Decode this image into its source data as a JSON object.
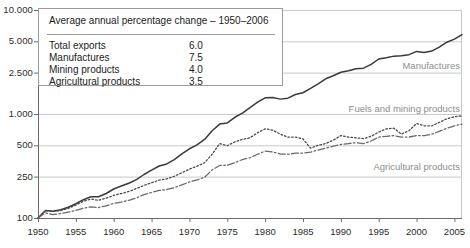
{
  "chart_data": {
    "type": "line",
    "title": "",
    "xlabel": "",
    "ylabel": "",
    "yscale": "log",
    "ylim": [
      100,
      10000
    ],
    "xlim": [
      1950,
      2006
    ],
    "grid": true,
    "legend_position": "inline-right",
    "ytick_labels": [
      "10.000",
      "5.000",
      "2.500",
      "1.000",
      "500",
      "250",
      "100"
    ],
    "ytick_values": [
      10000,
      5000,
      2500,
      1000,
      500,
      250,
      100
    ],
    "xtick_labels": [
      "1950",
      "1955",
      "1960",
      "1965",
      "1970",
      "1975",
      "1980",
      "1985",
      "1990",
      "1995",
      "2000",
      "2005"
    ],
    "xtick_values": [
      1950,
      1955,
      1960,
      1965,
      1970,
      1975,
      1980,
      1985,
      1990,
      1995,
      2000,
      2005
    ],
    "x": [
      1950,
      1951,
      1952,
      1953,
      1954,
      1955,
      1956,
      1957,
      1958,
      1959,
      1960,
      1961,
      1962,
      1963,
      1964,
      1965,
      1966,
      1967,
      1968,
      1969,
      1970,
      1971,
      1972,
      1973,
      1974,
      1975,
      1976,
      1977,
      1978,
      1979,
      1980,
      1981,
      1982,
      1983,
      1984,
      1985,
      1986,
      1987,
      1988,
      1989,
      1990,
      1991,
      1992,
      1993,
      1994,
      1995,
      1996,
      1997,
      1998,
      1999,
      2000,
      2001,
      2002,
      2003,
      2004,
      2005,
      2006
    ],
    "series": [
      {
        "name": "Manufactures",
        "style": "solid",
        "color": "#3a3a3a",
        "values": [
          100,
          118,
          116,
          120,
          127,
          137,
          150,
          160,
          160,
          172,
          190,
          203,
          216,
          234,
          262,
          288,
          316,
          331,
          364,
          414,
          463,
          505,
          570,
          690,
          800,
          820,
          930,
          1020,
          1150,
          1300,
          1430,
          1440,
          1390,
          1420,
          1540,
          1600,
          1760,
          1950,
          2180,
          2330,
          2520,
          2600,
          2720,
          2760,
          3000,
          3380,
          3480,
          3600,
          3630,
          3720,
          4000,
          3900,
          4030,
          4400,
          4900,
          5250,
          5800
        ]
      },
      {
        "name": "Fuels and mining products",
        "style": "dotted",
        "color": "#4a4a4a",
        "values": [
          100,
          118,
          116,
          118,
          124,
          133,
          145,
          152,
          148,
          155,
          165,
          172,
          180,
          192,
          206,
          218,
          231,
          238,
          252,
          272,
          295,
          315,
          340,
          410,
          520,
          495,
          540,
          570,
          590,
          660,
          720,
          700,
          640,
          600,
          600,
          575,
          470,
          500,
          520,
          560,
          620,
          600,
          590,
          580,
          610,
          670,
          720,
          730,
          640,
          690,
          810,
          770,
          770,
          830,
          900,
          940,
          960
        ]
      },
      {
        "name": "Agricultural products",
        "style": "dashdot",
        "color": "#6a6a6a",
        "values": [
          100,
          112,
          108,
          110,
          114,
          118,
          124,
          128,
          126,
          131,
          138,
          142,
          148,
          156,
          168,
          176,
          184,
          188,
          196,
          208,
          222,
          232,
          246,
          290,
          320,
          322,
          340,
          365,
          380,
          410,
          440,
          432,
          412,
          410,
          420,
          420,
          430,
          450,
          470,
          490,
          510,
          520,
          530,
          520,
          550,
          600,
          610,
          620,
          600,
          600,
          620,
          620,
          640,
          680,
          730,
          770,
          800
        ]
      }
    ],
    "annotations": [
      {
        "text": "Manufactures",
        "x": 2000,
        "y": 2800
      },
      {
        "text": "Fuels and mining products",
        "x": 1994,
        "y": 1100
      },
      {
        "text": "Agricultural products",
        "x": 1996,
        "y": 300
      }
    ]
  },
  "legend": {
    "title": "Average annual percentage change – 1950–2006",
    "rows": [
      {
        "name": "Total exports",
        "value": "6.0"
      },
      {
        "name": "Manufactures",
        "value": "7.5"
      },
      {
        "name": "Mining products",
        "value": "4.0"
      },
      {
        "name": "Agricultural products",
        "value": "3.5"
      }
    ]
  }
}
